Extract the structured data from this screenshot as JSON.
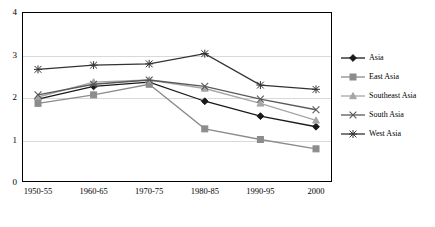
{
  "chart_data": {
    "type": "line",
    "title": "",
    "xlabel": "",
    "ylabel": "",
    "ylim": [
      0,
      4
    ],
    "yticks": [
      0,
      1,
      2,
      3,
      4
    ],
    "grid": true,
    "legend_position": "right",
    "categories": [
      "1950-55",
      "1960-65",
      "1970-75",
      "1980-85",
      "1990-95",
      "2000"
    ],
    "series": [
      {
        "name": "Asia",
        "marker": "diamond",
        "color": "#1a1a1a",
        "values": [
          1.95,
          2.25,
          2.35,
          1.9,
          1.55,
          1.3
        ]
      },
      {
        "name": "East Asia",
        "marker": "square",
        "color": "#8c8c8c",
        "values": [
          1.85,
          2.05,
          2.3,
          1.25,
          1.0,
          0.78
        ]
      },
      {
        "name": "Southeast Asia",
        "marker": "triangle",
        "color": "#a6a6a6",
        "values": [
          2.0,
          2.35,
          2.4,
          2.2,
          1.85,
          1.45
        ]
      },
      {
        "name": "South Asia",
        "marker": "cross",
        "color": "#595959",
        "values": [
          2.05,
          2.3,
          2.4,
          2.25,
          1.95,
          1.7
        ]
      },
      {
        "name": "West Asia",
        "marker": "star",
        "color": "#333333",
        "values": [
          2.65,
          2.75,
          2.78,
          3.02,
          2.28,
          2.18
        ]
      }
    ]
  },
  "legend": {
    "items": [
      {
        "label": "Asia"
      },
      {
        "label": "East Asia"
      },
      {
        "label": "Southeast Asia"
      },
      {
        "label": "South Asia"
      },
      {
        "label": "West Asia"
      }
    ]
  },
  "axes": {
    "ylabels": [
      "4",
      "3",
      "2",
      "1",
      "0"
    ],
    "xlabels": [
      "1950-55",
      "1960-65",
      "1970-75",
      "1980-85",
      "1990-95",
      "2000"
    ]
  }
}
